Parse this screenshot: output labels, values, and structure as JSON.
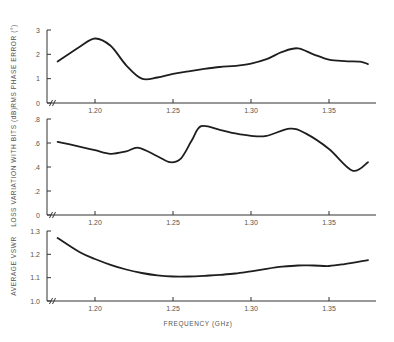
{
  "chart_data": [
    {
      "type": "line",
      "title": "",
      "ylabel": "RMS PHASE ERROR (°)",
      "xlabel": "",
      "ylim": [
        0,
        3
      ],
      "yticks": [
        0,
        1,
        2,
        3
      ],
      "ytick_labels": [
        "0",
        "1",
        "2",
        "3"
      ],
      "xlim": [
        1.17,
        1.38
      ],
      "xticks": [
        1.2,
        1.25,
        1.3,
        1.35
      ],
      "xtick_labels": [
        "1.20",
        "1.25",
        "1.30",
        "1.35"
      ],
      "axis_break": true,
      "grid": false,
      "series": [
        {
          "name": "RMS phase error",
          "x": [
            1.176,
            1.19,
            1.2,
            1.21,
            1.22,
            1.23,
            1.24,
            1.25,
            1.26,
            1.27,
            1.28,
            1.29,
            1.3,
            1.31,
            1.32,
            1.33,
            1.34,
            1.35,
            1.36,
            1.37,
            1.375
          ],
          "y": [
            1.7,
            2.3,
            2.65,
            2.35,
            1.55,
            1.0,
            1.05,
            1.2,
            1.3,
            1.4,
            1.48,
            1.53,
            1.62,
            1.8,
            2.1,
            2.25,
            2.0,
            1.78,
            1.72,
            1.7,
            1.6
          ]
        }
      ]
    },
    {
      "type": "line",
      "title": "",
      "ylabel": "LOSS VARIATION WITH BITS (dB)",
      "xlabel": "",
      "ylim": [
        0,
        0.8
      ],
      "yticks": [
        0,
        0.2,
        0.4,
        0.6,
        0.8
      ],
      "ytick_labels": [
        "0",
        ".2",
        ".4",
        ".6",
        ".8"
      ],
      "xlim": [
        1.17,
        1.38
      ],
      "xticks": [
        1.2,
        1.25,
        1.3,
        1.35
      ],
      "xtick_labels": [
        "1.20",
        "1.25",
        "1.30",
        "1.35"
      ],
      "axis_break": true,
      "grid": false,
      "series": [
        {
          "name": "Loss variation",
          "x": [
            1.176,
            1.19,
            1.2,
            1.21,
            1.22,
            1.228,
            1.24,
            1.248,
            1.255,
            1.262,
            1.268,
            1.28,
            1.29,
            1.3,
            1.31,
            1.325,
            1.335,
            1.35,
            1.365,
            1.375
          ],
          "y": [
            0.61,
            0.57,
            0.54,
            0.51,
            0.53,
            0.56,
            0.49,
            0.44,
            0.47,
            0.62,
            0.74,
            0.71,
            0.68,
            0.66,
            0.66,
            0.72,
            0.68,
            0.55,
            0.37,
            0.44
          ]
        }
      ]
    },
    {
      "type": "line",
      "title": "",
      "ylabel": "AVERAGE VSWR",
      "xlabel": "FREQUENCY (GHz)",
      "ylim": [
        1.0,
        1.3
      ],
      "yticks": [
        1.0,
        1.1,
        1.2,
        1.3
      ],
      "ytick_labels": [
        "1.0",
        "1.1",
        "1.2",
        "1.3"
      ],
      "xlim": [
        1.17,
        1.38
      ],
      "xticks": [
        1.2,
        1.25,
        1.3,
        1.35
      ],
      "xtick_labels": [
        "1.20",
        "1.25",
        "1.30",
        "1.35"
      ],
      "axis_break": true,
      "grid": false,
      "series": [
        {
          "name": "Average VSWR",
          "x": [
            1.176,
            1.19,
            1.2,
            1.21,
            1.22,
            1.23,
            1.24,
            1.25,
            1.26,
            1.27,
            1.28,
            1.29,
            1.3,
            1.31,
            1.32,
            1.33,
            1.34,
            1.35,
            1.36,
            1.375
          ],
          "y": [
            1.27,
            1.21,
            1.18,
            1.155,
            1.135,
            1.12,
            1.11,
            1.105,
            1.105,
            1.108,
            1.112,
            1.118,
            1.127,
            1.138,
            1.147,
            1.152,
            1.152,
            1.15,
            1.158,
            1.175
          ]
        }
      ]
    }
  ],
  "layout": {
    "x_px": {
      "v0": 1.2,
      "p0": 95,
      "v1": 1.35,
      "p1": 329
    },
    "axis_left": 47,
    "axis_right": 376,
    "panels": [
      {
        "y_px": {
          "v0": 0,
          "p0": 103,
          "v1": 3,
          "p1": 30
        },
        "axis_top": 30,
        "axis_bottom": 103,
        "ylabel_y": 66
      },
      {
        "y_px": {
          "v0": 0,
          "p0": 215,
          "v1": 0.8,
          "p1": 119
        },
        "axis_top": 119,
        "axis_bottom": 215,
        "ylabel_y": 167
      },
      {
        "y_px": {
          "v0": 1.0,
          "p0": 301,
          "v1": 1.3,
          "p1": 231
        },
        "axis_top": 231,
        "axis_bottom": 301,
        "ylabel_y": 266
      }
    ],
    "xlabel_pos": {
      "x": 198,
      "y": 326
    }
  }
}
